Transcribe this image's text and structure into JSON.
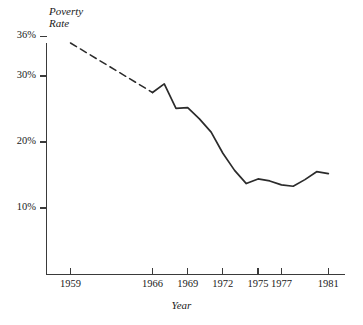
{
  "chart_data": {
    "type": "line",
    "title": "",
    "subtitle": "",
    "ylabel": "Poverty\nRate",
    "ylabel_lines": [
      "Poverty",
      "Rate"
    ],
    "xlabel": "Year",
    "xlim": [
      1959,
      1982.5
    ],
    "ylim": [
      0,
      36
    ],
    "grid": false,
    "legend": false,
    "legend_position": "none",
    "y_ticks": [
      {
        "value": 36,
        "label": "36%"
      },
      {
        "value": 30,
        "label": "30%"
      },
      {
        "value": 20,
        "label": "20%"
      },
      {
        "value": 10,
        "label": "10%"
      }
    ],
    "x_ticks": [
      {
        "value": 1959,
        "label": "1959"
      },
      {
        "value": 1966,
        "label": "1966"
      },
      {
        "value": 1969,
        "label": "1969"
      },
      {
        "value": 1972,
        "label": "1972"
      },
      {
        "value": 1975,
        "label": "1975"
      },
      {
        "value": 1977,
        "label": "1977"
      },
      {
        "value": 1981,
        "label": "1981"
      }
    ],
    "series": [
      {
        "name": "Poverty Rate (interpolated)",
        "style": "dashed",
        "color": "#2b2b2b",
        "x": [
          1959,
          1966
        ],
        "values": [
          35.0,
          27.5
        ]
      },
      {
        "name": "Poverty Rate",
        "style": "solid",
        "color": "#2b2b2b",
        "x": [
          1966,
          1967,
          1968,
          1969,
          1970,
          1971,
          1972,
          1973,
          1974,
          1975,
          1976,
          1977,
          1978,
          1979,
          1980,
          1981
        ],
        "values": [
          27.5,
          28.8,
          25.1,
          25.2,
          23.5,
          21.5,
          18.3,
          15.7,
          13.7,
          14.4,
          14.1,
          13.5,
          13.3,
          14.3,
          15.5,
          15.2
        ]
      }
    ],
    "annotations": []
  },
  "axes": {
    "y_title_line1": "Poverty",
    "y_title_line2": "Rate",
    "x_title": "Year"
  },
  "colors": {
    "line": "#2b2b2b",
    "axis": "#3a3a3a",
    "text": "#1a1a1a",
    "background": "#ffffff"
  }
}
